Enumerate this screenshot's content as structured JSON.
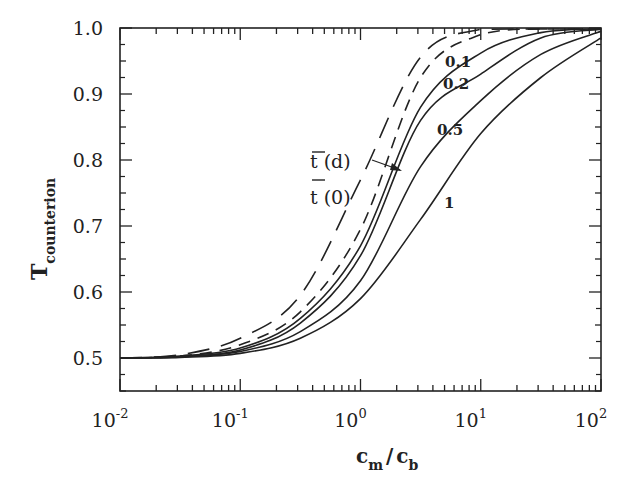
{
  "chart_data": {
    "type": "line",
    "title": "",
    "xlabel": "c_m / c_b",
    "ylabel": "T_counterion",
    "xscale": "log",
    "xlim": [
      0.01,
      100
    ],
    "ylim": [
      0.45,
      1.0
    ],
    "grid": false,
    "legend": "inline labels",
    "x_ticks": [
      "10^-2",
      "10^-1",
      "10^0",
      "10^1",
      "10^2"
    ],
    "y_ticks": [
      "0.5",
      "0.6",
      "0.7",
      "0.8",
      "0.9",
      "1.0"
    ],
    "x": [
      0.01,
      0.0316,
      0.1,
      0.316,
      1,
      3.16,
      10,
      31.6,
      100
    ],
    "series": [
      {
        "name": "t(0)",
        "style": "long-dash",
        "values": [
          0.5,
          0.505,
          0.53,
          0.595,
          0.77,
          0.956,
          0.998,
          1.0,
          1.0
        ]
      },
      {
        "name": "t(d)",
        "style": "medium-dash",
        "values": [
          0.5,
          0.503,
          0.52,
          0.57,
          0.695,
          0.925,
          0.99,
          1.0,
          1.0
        ]
      },
      {
        "name": "0.1",
        "style": "solid",
        "values": [
          0.5,
          0.503,
          0.515,
          0.56,
          0.67,
          0.88,
          0.962,
          0.993,
          1.0
        ]
      },
      {
        "name": "0.2",
        "style": "solid",
        "values": [
          0.5,
          0.502,
          0.512,
          0.553,
          0.655,
          0.86,
          0.93,
          0.985,
          0.998
        ]
      },
      {
        "name": "0.5",
        "style": "solid",
        "values": [
          0.5,
          0.502,
          0.51,
          0.54,
          0.617,
          0.79,
          0.89,
          0.96,
          0.995
        ]
      },
      {
        "name": "1",
        "style": "solid",
        "values": [
          0.5,
          0.501,
          0.507,
          0.53,
          0.59,
          0.71,
          0.84,
          0.925,
          0.985
        ]
      }
    ],
    "annotations": [
      {
        "text": "t(d)",
        "overline": true,
        "arrow": true
      },
      {
        "text": "t(0)",
        "overline": true
      },
      {
        "text": "0.1"
      },
      {
        "text": "0.2"
      },
      {
        "text": "0.5"
      },
      {
        "text": "1"
      }
    ]
  },
  "labels": {
    "y_main": "T",
    "y_sub": "counterion",
    "x_c1": "c",
    "x_sub1": "m",
    "x_slash": "/",
    "x_c2": "c",
    "x_sub2": "b",
    "td": "t (d)",
    "t0": "t (0)",
    "c01": "0.1",
    "c02": "0.2",
    "c05": "0.5",
    "c1": "1"
  }
}
